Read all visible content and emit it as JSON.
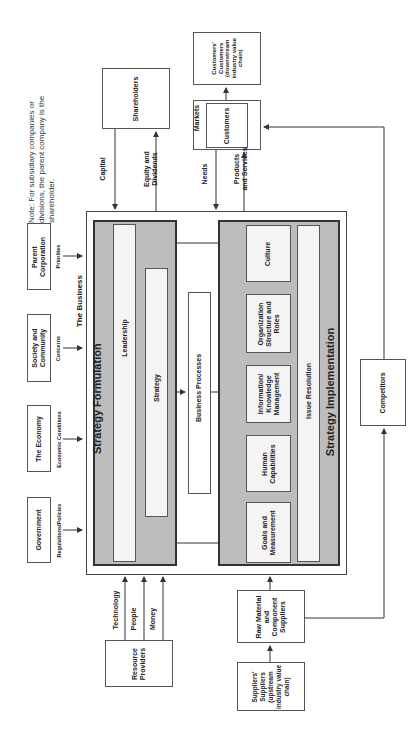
{
  "note": {
    "lines": [
      "Note: For subsidiary companies or",
      "divisions, the parent company is the",
      "shareholder."
    ]
  },
  "external_top_inputs": [
    {
      "box": "Government",
      "flow": "Regulations/Policies"
    },
    {
      "box": "The Economy",
      "flow": "Economic Conditions"
    },
    {
      "box": "Society and Community",
      "flow": "Concerns"
    },
    {
      "box": "Parent Corporation",
      "flow": "Priorities"
    }
  ],
  "business": {
    "label": "The Business",
    "strategy_formulation": {
      "title": "Strategy Formulation",
      "leadership": "Leadership",
      "strategy": "Strategy"
    },
    "business_processes": "Business Processes",
    "strategy_implementation": {
      "title": "Strategy Implementation",
      "components": [
        "Goals and Measurement",
        "Human Capabilities",
        "Information/ Knowledge Management",
        "Organization Structure and Roles",
        "Culture"
      ],
      "issue_resolution": "Issue Resolution"
    }
  },
  "shareholders": {
    "box": "Shareholders",
    "capital": "Capital",
    "equity": "Equity and Dividends"
  },
  "markets": {
    "markets_label": "Markets",
    "customers": "Customers",
    "needs": "Needs",
    "products": "Products and Services",
    "customers_customers": "Customers' Customers (downstream industry value chain)"
  },
  "resource_providers": {
    "box": "Resource Providers",
    "flows": [
      "Technology",
      "People",
      "Money"
    ]
  },
  "suppliers": {
    "raw_material": "Raw Material and Component Suppliers",
    "suppliers_suppliers": "Suppliers' Suppliers (upstream industry value chain)"
  },
  "competitors": "Competitors",
  "colors": {
    "panel_gray": "#bdbdbd",
    "inner_light": "#f4f4f4",
    "line": "#333333"
  }
}
